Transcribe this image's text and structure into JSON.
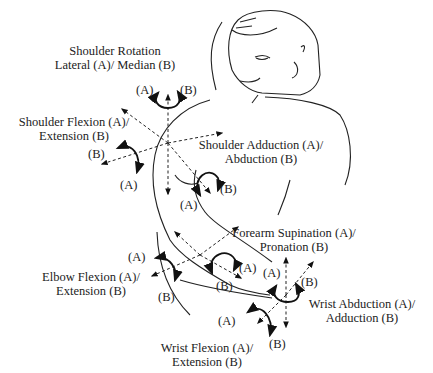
{
  "diagram": {
    "movements": [
      {
        "id": "shoulder-rotation",
        "line1": "Shoulder Rotation",
        "line2": "Lateral (A)/ Median (B)",
        "a": "(A)",
        "b": "(B)"
      },
      {
        "id": "shoulder-flexion",
        "line1": "Shoulder Flexion  (A)/",
        "line2": "Extension (B)",
        "a": "(A)",
        "b": "(B)"
      },
      {
        "id": "shoulder-adduction",
        "line1": "Shoulder Adduction (A)/",
        "line2": "Abduction (B)",
        "a": "(A)",
        "b": "(B)"
      },
      {
        "id": "elbow-flexion",
        "line1": "Elbow Flexion (A)/",
        "line2": "Extension (B)",
        "a": "(A)",
        "b": "(B)"
      },
      {
        "id": "forearm-supination",
        "line1": "Forearm Supination (A)/",
        "line2": "Pronation (B)",
        "a": "(A)",
        "b": "(B)"
      },
      {
        "id": "wrist-abduction",
        "line1": "Wrist Abduction (A)/",
        "line2": "Adduction (B)",
        "a": "(A)",
        "b": "(B)"
      },
      {
        "id": "wrist-flexion",
        "line1": "Wrist Flexion (A)/",
        "line2": "Extension (B)",
        "a": "(A)",
        "b": "(B)"
      }
    ]
  }
}
